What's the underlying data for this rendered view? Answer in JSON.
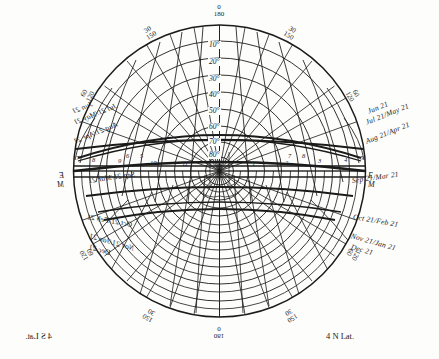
{
  "diagram": {
    "type": "sun-path-diagram",
    "ink_color": "#1b1b1b",
    "paper_color": "#fdfdfc"
  },
  "corner_labels": {
    "bottom_right": "4 N Lat.",
    "bottom_left": "4 S Lat."
  },
  "cardinal_labels": {
    "east_right": "E",
    "west_right": "M",
    "east_left": "E",
    "west_left": "M"
  },
  "azimuth_labels": [
    {
      "top": "0",
      "bottom": "180",
      "x": 219,
      "y": 10,
      "rot": 0
    },
    {
      "top": "30",
      "bottom": "150",
      "x": 150,
      "y": 32,
      "rot": -32
    },
    {
      "top": "30",
      "bottom": "150",
      "x": 290,
      "y": 32,
      "rot": 32
    },
    {
      "top": "60",
      "bottom": "120",
      "x": 352,
      "y": 94,
      "rot": 62
    },
    {
      "top": "60",
      "bottom": "120",
      "x": 88,
      "y": 94,
      "rot": -62
    },
    {
      "top": "120",
      "bottom": "60",
      "x": 352,
      "y": 252,
      "rot": 118
    },
    {
      "top": "120",
      "bottom": "60",
      "x": 88,
      "y": 252,
      "rot": -118
    },
    {
      "top": "150",
      "bottom": "30",
      "x": 290,
      "y": 313,
      "rot": 148
    },
    {
      "top": "150",
      "bottom": "30",
      "x": 150,
      "y": 313,
      "rot": -148
    },
    {
      "top": "180",
      "bottom": "0",
      "x": 219,
      "y": 330,
      "rot": 180
    }
  ],
  "altitude_labels": [
    {
      "text": "10°",
      "y": 46
    },
    {
      "text": "20°",
      "y": 63
    },
    {
      "text": "30°",
      "y": 80
    },
    {
      "text": "40°",
      "y": 96
    },
    {
      "text": "50°",
      "y": 112
    },
    {
      "text": "60°",
      "y": 128
    },
    {
      "text": "70°",
      "y": 143
    },
    {
      "text": "80°",
      "y": 156
    }
  ],
  "hour_labels_right": [
    "1",
    "2",
    "3",
    "4",
    "5"
  ],
  "hour_labels_left": [
    "11",
    "10",
    "9",
    "8",
    "7"
  ],
  "hour_labels_inner_right": [
    "7",
    "8"
  ],
  "hour_labels_inner_left": [
    "5",
    "6"
  ],
  "month_labels_right": [
    {
      "text": "Jun 21",
      "x": 368,
      "y": 108,
      "rot": -22
    },
    {
      "text": "Jul 21/May 21",
      "x": 366,
      "y": 119,
      "rot": -22
    },
    {
      "text": "Aug 21/Apr 21",
      "x": 366,
      "y": 138,
      "rot": -22
    },
    {
      "text": "Sep 21/Mar 21",
      "x": 352,
      "y": 177,
      "rot": -8
    },
    {
      "text": "Oct 21/Feb 21",
      "x": 353,
      "y": 213,
      "rot": 10
    },
    {
      "text": "Nov 21/Jan 21",
      "x": 351,
      "y": 232,
      "rot": 16
    },
    {
      "text": "Dec 21",
      "x": 351,
      "y": 243,
      "rot": 16
    }
  ],
  "month_labels_left": [
    {
      "text": "Jun 21",
      "x": 72,
      "y": 108,
      "rot": 22
    },
    {
      "text": "Jul 21/May 21",
      "x": 74,
      "y": 119,
      "rot": 22
    },
    {
      "text": "Aug 21/Apr 21",
      "x": 74,
      "y": 138,
      "rot": 22
    },
    {
      "text": "Sep 21/Mar 21",
      "x": 88,
      "y": 177,
      "rot": 8
    },
    {
      "text": "Oct 21/Feb 21",
      "x": 87,
      "y": 213,
      "rot": -10
    },
    {
      "text": "Nov 21/Jan 21",
      "x": 89,
      "y": 232,
      "rot": -16
    },
    {
      "text": "Dec 21",
      "x": 89,
      "y": 243,
      "rot": -16
    }
  ],
  "chart_data": {
    "type": "scatter",
    "xlabel": "Azimuth (degrees)",
    "ylabel": "Altitude (degrees)",
    "azimuth_ticks": [
      0,
      30,
      60,
      90,
      120,
      150,
      180
    ],
    "azimuth_ticks_mirror": [
      180,
      150,
      120,
      90,
      60,
      30,
      0
    ],
    "altitude_rings": [
      10,
      20,
      30,
      40,
      50,
      60,
      70,
      80,
      90
    ],
    "declination_curves": [
      "Jun 21",
      "Jul 21/May 21",
      "Aug 21/Apr 21",
      "Sep 21/Mar 21",
      "Oct 21/Feb 21",
      "Nov 21/Jan 21",
      "Dec 21"
    ],
    "hour_lines": [
      "5",
      "6",
      "7",
      "8",
      "9",
      "10",
      "11",
      "12",
      "1",
      "2",
      "3",
      "4",
      "5",
      "6",
      "7"
    ],
    "grid": true,
    "legend": "none"
  }
}
